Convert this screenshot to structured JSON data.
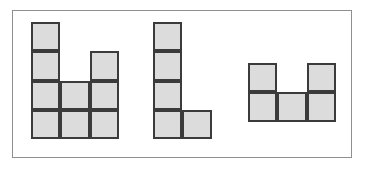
{
  "panel": {
    "background_color": "#ffffff",
    "frame": {
      "border_color": "#8f8f8f",
      "x": 12,
      "y": 10,
      "width": 340,
      "height": 148
    }
  },
  "style": {
    "cell_fill_color": "#dcdcdc",
    "cell_border_color": "#3b3b3b",
    "cell_border_width": 2
  },
  "shapes": [
    {
      "name": "shape-left",
      "label": "",
      "x": 31,
      "y": 22,
      "cell_width": 29.3,
      "cell_height": 29.3,
      "columns": 3,
      "rows": 4,
      "cell_count": 9,
      "grid": [
        [
          1,
          0,
          0
        ],
        [
          1,
          0,
          1
        ],
        [
          1,
          1,
          1
        ],
        [
          1,
          1,
          1
        ]
      ]
    },
    {
      "name": "shape-middle",
      "label": "",
      "x": 153,
      "y": 22,
      "cell_width": 29.3,
      "cell_height": 29.3,
      "columns": 2,
      "rows": 4,
      "cell_count": 5,
      "grid": [
        [
          1,
          0
        ],
        [
          1,
          0
        ],
        [
          1,
          0
        ],
        [
          1,
          1
        ]
      ]
    },
    {
      "name": "shape-right",
      "label": "",
      "x": 248,
      "y": 63,
      "cell_width": 29.3,
      "cell_height": 29.3,
      "columns": 3,
      "rows": 2,
      "cell_count": 5,
      "grid": [
        [
          1,
          0,
          1
        ],
        [
          1,
          1,
          1
        ]
      ]
    }
  ]
}
